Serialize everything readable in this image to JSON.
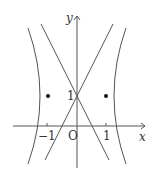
{
  "figure": {
    "axes": {
      "x_label": "x",
      "y_label": "y",
      "origin_label": "O"
    },
    "ticks": {
      "x_neg": "−1",
      "x_pos": "1",
      "y_pos": "1"
    },
    "curves": [
      {
        "name": "hyperbola",
        "equation": "x^2 - (y-1)^2/4 = 1"
      },
      {
        "name": "asymptote-1",
        "equation": "y = 2x + 1"
      },
      {
        "name": "asymptote-2",
        "equation": "y = -2x + 1"
      }
    ],
    "points": [
      {
        "x": -1,
        "y": 1
      },
      {
        "x": 1,
        "y": 1
      }
    ],
    "colors": {
      "line": "#555555",
      "point": "#111111"
    }
  }
}
